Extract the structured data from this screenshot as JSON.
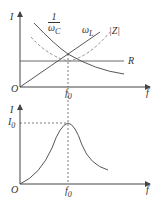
{
  "top_chart": {
    "y_axis_label": "I",
    "x_axis_label": "f",
    "origin_label": "O",
    "resonance_label": "f",
    "resonance_sub": "0",
    "curves": {
      "capacitive": {
        "num": "1",
        "den": "ωC",
        "den_main": "ω",
        "den_sub": "C"
      },
      "inductive": {
        "main": "ω",
        "sub": "L"
      },
      "impedance": "|Z|",
      "resistance": "R"
    }
  },
  "bottom_chart": {
    "y_axis_label": "I",
    "x_axis_label": "f",
    "origin_label": "O",
    "peak_label": "I",
    "peak_sub": "0",
    "resonance_label": "f",
    "resonance_sub": "0"
  },
  "colors": {
    "line": "#444444",
    "dashed": "#888888"
  }
}
